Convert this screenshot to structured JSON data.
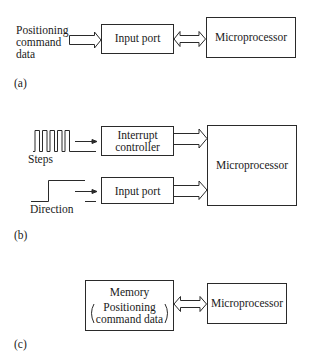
{
  "panel_a": {
    "caption": "(a)",
    "input_label": [
      "Positioning",
      "command",
      "data"
    ],
    "input_port": "Input port",
    "microprocessor": "Microprocessor"
  },
  "panel_b": {
    "caption": "(b)",
    "steps_label": "Steps",
    "direction_label": "Direction",
    "interrupt_controller": [
      "Interrupt",
      "controller"
    ],
    "input_port": "Input port",
    "microprocessor": "Microprocessor"
  },
  "panel_c": {
    "caption": "(c)",
    "memory": {
      "title": "Memory",
      "contents": [
        "Positioning",
        "command data"
      ]
    },
    "microprocessor": "Microprocessor"
  },
  "colors": {
    "line": "#2a2a2a",
    "background": "#ffffff"
  }
}
